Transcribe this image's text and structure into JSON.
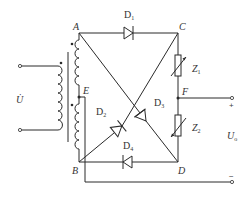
{
  "diagram": {
    "type": "bridge rectifier circuit with transformer",
    "nodes": {
      "A": "A",
      "B": "B",
      "C": "C",
      "D": "D",
      "E": "E",
      "F": "F"
    },
    "diodes": {
      "d1": {
        "letter": "D",
        "sub": "1"
      },
      "d2": {
        "letter": "D",
        "sub": "2"
      },
      "d3": {
        "letter": "D",
        "sub": "3"
      },
      "d4": {
        "letter": "D",
        "sub": "4"
      }
    },
    "impedances": {
      "z1": {
        "letter": "Z",
        "sub": "1"
      },
      "z2": {
        "letter": "Z",
        "sub": "2"
      }
    },
    "input_voltage": "U̇",
    "output_voltage": {
      "letter": "U",
      "sub": "o"
    },
    "output_plus": "+",
    "output_minus": "−",
    "colors": {
      "line": "#2a2a2a",
      "background": "#ffffff"
    }
  }
}
